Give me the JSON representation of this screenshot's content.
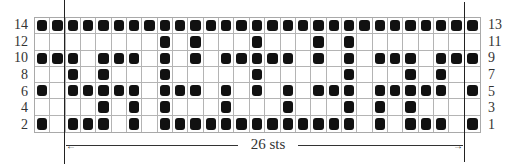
{
  "chart_data": {
    "type": "table",
    "columns": 29,
    "rows": 7,
    "left_row_labels": [
      "14",
      "12",
      "10",
      "8",
      "6",
      "4",
      "2"
    ],
    "right_row_labels": [
      "13",
      "11",
      "9",
      "7",
      "5",
      "3",
      "1"
    ],
    "width_annotation": "26 sts",
    "filled_cells_by_row": [
      {
        "row_labels": [
          "14",
          "13"
        ],
        "filled_cols": [
          0,
          1,
          2,
          3,
          4,
          5,
          6,
          7,
          8,
          9,
          10,
          11,
          12,
          13,
          14,
          15,
          16,
          17,
          18,
          19,
          20,
          21,
          22,
          23,
          24,
          25,
          26,
          27,
          28
        ]
      },
      {
        "row_labels": [
          "12",
          "11"
        ],
        "filled_cols": [
          8,
          10,
          14,
          18,
          20
        ]
      },
      {
        "row_labels": [
          "10",
          "9"
        ],
        "filled_cols": [
          0,
          1,
          2,
          4,
          5,
          6,
          8,
          10,
          12,
          13,
          14,
          15,
          16,
          18,
          20,
          22,
          23,
          24,
          26,
          27,
          28
        ]
      },
      {
        "row_labels": [
          "8",
          "7"
        ],
        "filled_cols": [
          2,
          4,
          8,
          14,
          20,
          24,
          26
        ]
      },
      {
        "row_labels": [
          "6",
          "5"
        ],
        "filled_cols": [
          0,
          2,
          3,
          4,
          5,
          6,
          8,
          9,
          10,
          12,
          14,
          16,
          18,
          19,
          20,
          22,
          23,
          24,
          25,
          26,
          28
        ]
      },
      {
        "row_labels": [
          "4",
          "3"
        ],
        "filled_cols": [
          4,
          6,
          8,
          12,
          16,
          20,
          22,
          24
        ]
      },
      {
        "row_labels": [
          "2",
          "1"
        ],
        "filled_cols": [
          0,
          2,
          3,
          4,
          6,
          8,
          9,
          10,
          11,
          12,
          13,
          14,
          15,
          16,
          17,
          18,
          19,
          20,
          22,
          24,
          25,
          26,
          28
        ]
      }
    ],
    "colors": {
      "filled": "#111111",
      "empty": "#ffffff",
      "gridline": "#b4b4b4"
    }
  },
  "annotation": {
    "stitch_count_label": "26 sts",
    "arrow_left": "←",
    "arrow_right": "→"
  }
}
